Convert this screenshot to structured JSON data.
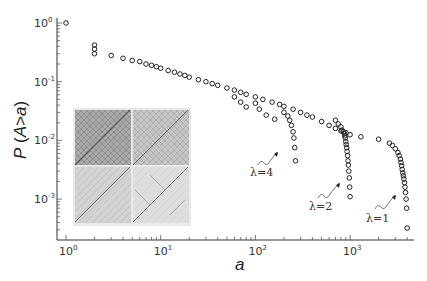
{
  "chart_data": {
    "type": "scatter",
    "title": "",
    "xlabel": "a",
    "ylabel": "P (A>a)",
    "xscale": "log",
    "yscale": "log",
    "xlim": [
      0.85,
      4500
    ],
    "ylim": [
      0.00022,
      1.2
    ],
    "x_ticks": [
      {
        "value": 1,
        "base": "10",
        "exp": "0"
      },
      {
        "value": 10,
        "base": "10",
        "exp": "1"
      },
      {
        "value": 100,
        "base": "10",
        "exp": "2"
      },
      {
        "value": 1000,
        "base": "10",
        "exp": "3"
      }
    ],
    "y_ticks": [
      {
        "value": 1,
        "base": "10",
        "exp": "0"
      },
      {
        "value": 0.1,
        "base": "10",
        "exp": "-1"
      },
      {
        "value": 0.01,
        "base": "10",
        "exp": "-2"
      },
      {
        "value": 0.001,
        "base": "10",
        "exp": "-3"
      }
    ],
    "grid": false,
    "legend": null,
    "marker": "open-circle",
    "inset": {
      "description": "2x2 grid of grayscale space-time patterns (diagonal avalanche structures)"
    },
    "series": [
      {
        "name": "λ=1",
        "annotation": "λ=1",
        "x": [
          1,
          2,
          2,
          2,
          3,
          4,
          5,
          6,
          7,
          8,
          9,
          10,
          12,
          14,
          16,
          18,
          20,
          25,
          30,
          35,
          40,
          50,
          60,
          70,
          80,
          100,
          120,
          150,
          180,
          200,
          250,
          300,
          350,
          400,
          500,
          600,
          700,
          800,
          900,
          1000,
          1300,
          2000,
          2600,
          2800,
          3000,
          3200,
          3300,
          3400,
          3450,
          3500,
          3550,
          3600,
          3650,
          3700,
          3750,
          3800,
          3850,
          3900,
          3950,
          4000
        ],
        "y": [
          1.0,
          0.42,
          0.36,
          0.3,
          0.28,
          0.25,
          0.23,
          0.22,
          0.2,
          0.19,
          0.18,
          0.17,
          0.155,
          0.145,
          0.135,
          0.128,
          0.12,
          0.108,
          0.1,
          0.093,
          0.087,
          0.078,
          0.072,
          0.066,
          0.061,
          0.055,
          0.05,
          0.045,
          0.041,
          0.038,
          0.034,
          0.03,
          0.027,
          0.025,
          0.021,
          0.018,
          0.016,
          0.0145,
          0.0135,
          0.0125,
          0.0115,
          0.0105,
          0.009,
          0.0082,
          0.0072,
          0.0062,
          0.0055,
          0.0048,
          0.0042,
          0.0037,
          0.0032,
          0.0028,
          0.0025,
          0.0022,
          0.0019,
          0.0016,
          0.0013,
          0.001,
          0.0007,
          0.00032
        ]
      },
      {
        "name": "λ=2",
        "annotation": "λ=2",
        "x": [
          700,
          750,
          800,
          820,
          850,
          870,
          880,
          890,
          900,
          910,
          920,
          930,
          940,
          950,
          960,
          970,
          980,
          990,
          1000
        ],
        "y": [
          0.022,
          0.019,
          0.017,
          0.015,
          0.014,
          0.013,
          0.012,
          0.011,
          0.0095,
          0.0085,
          0.0075,
          0.0065,
          0.0055,
          0.0045,
          0.0038,
          0.003,
          0.0023,
          0.0016,
          0.0011
        ]
      },
      {
        "name": "λ=4",
        "annotation": "λ=4",
        "x": [
          60,
          70,
          80,
          100,
          110,
          130,
          160,
          200,
          220,
          230,
          240,
          250,
          255,
          260,
          265
        ],
        "y": [
          0.055,
          0.045,
          0.037,
          0.043,
          0.034,
          0.027,
          0.023,
          0.03,
          0.026,
          0.022,
          0.018,
          0.014,
          0.011,
          0.0075,
          0.0045
        ]
      }
    ]
  },
  "annotations": {
    "lambda4": "λ=4",
    "lambda2": "λ=2",
    "lambda1": "λ=1"
  },
  "axes": {
    "xlabel": "a",
    "ylabel_prefix": "P (",
    "ylabel_italic": "A>a",
    "ylabel_suffix": ")"
  }
}
